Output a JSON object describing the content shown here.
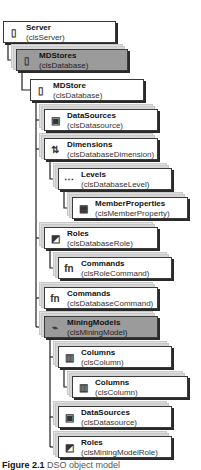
{
  "diagram": {
    "nodes": [
      {
        "id": "server",
        "name": "Server",
        "class": "(clsServer)",
        "icon": "server-icon",
        "glyph": "▯",
        "highlight": false,
        "stacked": false
      },
      {
        "id": "mdstores",
        "name": "MDStores",
        "class": "(clsDatabase)",
        "icon": "database-icon",
        "glyph": "▯",
        "highlight": true,
        "stacked": true
      },
      {
        "id": "mdstore",
        "name": "MDStore",
        "class": "(clsDatabase)",
        "icon": "database-icon",
        "glyph": "▯",
        "highlight": false,
        "stacked": false
      },
      {
        "id": "datasources",
        "name": "DataSources",
        "class": "(clsDatasource)",
        "icon": "datasource-icon",
        "glyph": "▣",
        "highlight": false,
        "stacked": true
      },
      {
        "id": "dimensions",
        "name": "Dimensions",
        "class": "(clsDatabaseDimension)",
        "icon": "dimension-icon",
        "glyph": "⇅",
        "highlight": false,
        "stacked": true
      },
      {
        "id": "levels",
        "name": "Levels",
        "class": "(clsDatabaseLevel)",
        "icon": "level-icon",
        "glyph": "⋯",
        "highlight": false,
        "stacked": true
      },
      {
        "id": "memberproperties",
        "name": "MemberProperties",
        "class": "(clsMemberProperty)",
        "icon": "member-property-icon",
        "glyph": "▦",
        "highlight": false,
        "stacked": true
      },
      {
        "id": "roles",
        "name": "Roles",
        "class": "(clsDatabaseRole)",
        "icon": "role-icon",
        "glyph": "◩",
        "highlight": false,
        "stacked": true
      },
      {
        "id": "rolecommands",
        "name": "Commands",
        "class": "(clsRoleCommand)",
        "icon": "command-icon",
        "glyph": "fn",
        "highlight": false,
        "stacked": true
      },
      {
        "id": "dbcommands",
        "name": "Commands",
        "class": "(clsDatabaseCommand)",
        "icon": "command-icon",
        "glyph": "fn",
        "highlight": false,
        "stacked": true
      },
      {
        "id": "miningmodels",
        "name": "MiningModels",
        "class": "(clsMiningModel)",
        "icon": "mining-model-icon",
        "glyph": "⌁",
        "highlight": true,
        "stacked": true
      },
      {
        "id": "columns1",
        "name": "Columns",
        "class": "(clsColumn)",
        "icon": "column-icon",
        "glyph": "▥",
        "highlight": false,
        "stacked": true
      },
      {
        "id": "columns2",
        "name": "Columns",
        "class": "(clsColumn)",
        "icon": "column-icon",
        "glyph": "▥",
        "highlight": false,
        "stacked": true
      },
      {
        "id": "mmdatasources",
        "name": "DataSources",
        "class": "(clsDatasource)",
        "icon": "datasource-icon",
        "glyph": "▣",
        "highlight": false,
        "stacked": true
      },
      {
        "id": "mmroles",
        "name": "Roles",
        "class": "(clsMiningModelRole)",
        "icon": "role-icon",
        "glyph": "◩",
        "highlight": false,
        "stacked": true
      }
    ],
    "edges": [
      [
        "server",
        "mdstores"
      ],
      [
        "mdstores",
        "mdstore"
      ],
      [
        "mdstore",
        "datasources"
      ],
      [
        "mdstore",
        "dimensions"
      ],
      [
        "dimensions",
        "levels"
      ],
      [
        "levels",
        "memberproperties"
      ],
      [
        "mdstore",
        "roles"
      ],
      [
        "roles",
        "rolecommands"
      ],
      [
        "mdstore",
        "dbcommands"
      ],
      [
        "mdstore",
        "miningmodels"
      ],
      [
        "miningmodels",
        "columns1"
      ],
      [
        "columns1",
        "columns2"
      ],
      [
        "miningmodels",
        "mmdatasources"
      ],
      [
        "miningmodels",
        "mmroles"
      ]
    ]
  },
  "caption": {
    "label": "Figure 2.1",
    "text": "DSO object model"
  }
}
